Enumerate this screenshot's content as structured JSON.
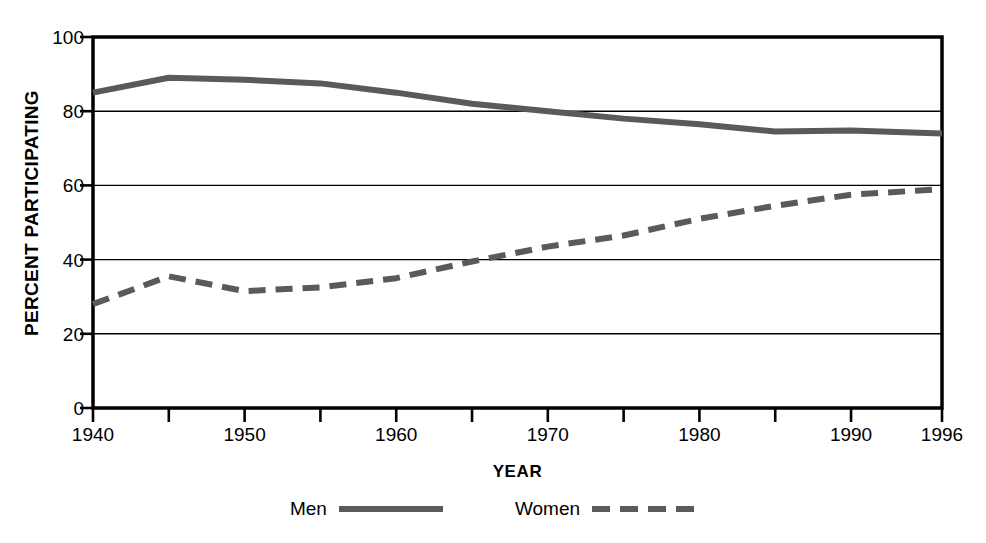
{
  "chart_data": {
    "type": "line",
    "title": "",
    "xlabel": "YEAR",
    "ylabel": "PERCENT PARTICIPATING",
    "xlim": [
      1940,
      1996
    ],
    "ylim": [
      0,
      100
    ],
    "grid": true,
    "legend_position": "bottom",
    "x": [
      1940,
      1945,
      1950,
      1955,
      1960,
      1965,
      1970,
      1975,
      1980,
      1985,
      1990,
      1996
    ],
    "x_tick_labels": [
      "1940",
      "1950",
      "1960",
      "1970",
      "1980",
      "1990",
      "1996"
    ],
    "x_tick_values": [
      1940,
      1950,
      1960,
      1970,
      1980,
      1990,
      1996
    ],
    "x_minor_ticks": [
      1945,
      1955,
      1965,
      1975,
      1985
    ],
    "y_tick_labels": [
      "0",
      "20",
      "40",
      "60",
      "80",
      "100"
    ],
    "y_tick_values": [
      0,
      20,
      40,
      60,
      80,
      100
    ],
    "series": [
      {
        "name": "Men",
        "style": "solid",
        "color": "#5a5a5a",
        "values": [
          85,
          89,
          88.5,
          87.5,
          85,
          82,
          80,
          78,
          76.5,
          74.5,
          74.8,
          74
        ]
      },
      {
        "name": "Women",
        "style": "dashed",
        "color": "#5a5a5a",
        "values": [
          28,
          35.5,
          31.5,
          32.5,
          35,
          39.5,
          43.5,
          46.5,
          51,
          54.5,
          57.5,
          59
        ]
      }
    ]
  },
  "legend": {
    "items": [
      {
        "label": "Men",
        "style": "solid"
      },
      {
        "label": "Women",
        "style": "dashed"
      }
    ]
  },
  "colors": {
    "line": "#5a5a5a",
    "frame": "#000000",
    "gridline": "#000000",
    "text": "#000000",
    "background": "#ffffff"
  }
}
